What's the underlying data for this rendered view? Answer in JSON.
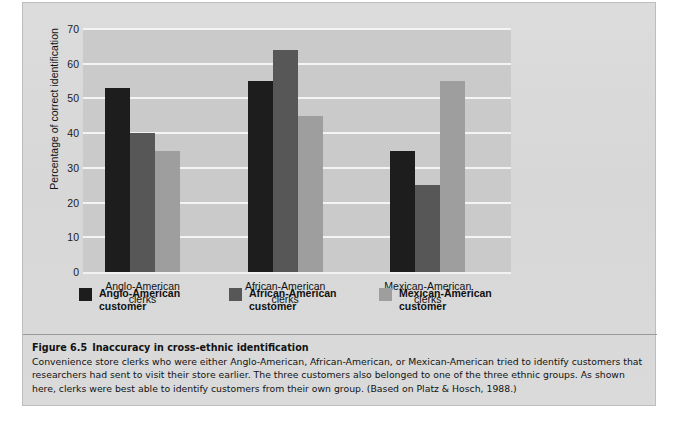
{
  "figure": {
    "caption_number": "Figure 6.5",
    "caption_title": "Inaccuracy in cross-ethnic identification",
    "caption_body": "Convenience store clerks who were either Anglo-American, African-American, or Mexican-American tried to identify customers that researchers had sent to visit their store earlier. The three customers also belonged to one of the three ethnic groups. As shown here, clerks were best able to identify customers from their own group. (Based on Platz & Hosch, 1988.)"
  },
  "colors": {
    "series_anglo": "#1d1d1d",
    "series_african": "#575757",
    "series_mexican": "#9e9e9e",
    "plot_background": "#cacaca",
    "gridline": "#f4f4f4",
    "page_background": "#d9d9d9"
  },
  "chart_data": {
    "type": "bar",
    "title": "",
    "xlabel": "",
    "ylabel": "Percentage of correct identification",
    "categories": [
      "Anglo-American clerks",
      "African-American clerks",
      "Mexican-American clerks"
    ],
    "category_lines": [
      [
        "Anglo-American",
        "clerks"
      ],
      [
        "African-American",
        "clerks"
      ],
      [
        "Mexican-American",
        "clerks"
      ]
    ],
    "series": [
      {
        "name": "Anglo-American customer",
        "name_lines": [
          "Anglo-American",
          "customer"
        ],
        "color": "#1d1d1d",
        "values": [
          53,
          55,
          35
        ]
      },
      {
        "name": "African-American customer",
        "name_lines": [
          "African-American",
          "customer"
        ],
        "color": "#575757",
        "values": [
          40,
          64,
          25
        ]
      },
      {
        "name": "Mexican-American customer",
        "name_lines": [
          "Mexican-American",
          "customer"
        ],
        "color": "#9e9e9e",
        "values": [
          35,
          45,
          55
        ]
      }
    ],
    "ylim": [
      0,
      70
    ],
    "yticks": [
      0,
      10,
      20,
      30,
      40,
      50,
      60,
      70
    ],
    "ytick_labels": [
      "0",
      "10",
      "20",
      "30",
      "40",
      "50",
      "60",
      "70"
    ],
    "grid": true,
    "legend_position": "below"
  }
}
